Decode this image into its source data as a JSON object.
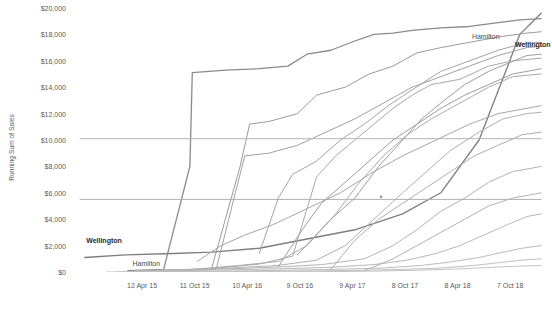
{
  "chart_data": {
    "type": "line",
    "title": "",
    "xlabel": "",
    "ylabel": "Running Sum of Sales",
    "ylim": [
      0,
      20000
    ],
    "grid": false,
    "legend": "none",
    "y_ticks": [
      "$0",
      "$2,000",
      "$4,000",
      "$6,000",
      "$8,000",
      "$10,000",
      "$12,000",
      "$14,000",
      "$16,000",
      "$18,000",
      "$20,000"
    ],
    "y_tick_values": [
      0,
      2000,
      4000,
      6000,
      8000,
      10000,
      12000,
      14000,
      16000,
      18000,
      20000
    ],
    "x_ticks": [
      "12 Apr 15",
      "11 Oct 15",
      "10 Apr 16",
      "9 Oct 16",
      "9 Apr 17",
      "8 Oct 17",
      "8 Apr 18",
      "7 Oct 18"
    ],
    "x_tick_positions": [
      0.155,
      0.265,
      0.375,
      0.485,
      0.595,
      0.705,
      0.815,
      0.925
    ],
    "annotations": [
      {
        "name": "hamilton-top-label",
        "text": "Hamilton",
        "x": 0.845,
        "y": 0.115,
        "bold": false
      },
      {
        "name": "wellington-top-label",
        "text": "Wellington",
        "x": 0.935,
        "y": 0.145,
        "bold": true
      },
      {
        "name": "wellington-bottom-label",
        "text": "Wellington",
        "x": 0.038,
        "y": 0.885,
        "bold": true
      },
      {
        "name": "hamilton-bottom-label",
        "text": "Hamilton",
        "x": 0.135,
        "y": 0.975,
        "bold": false
      }
    ],
    "series": [
      {
        "name": "Wellington",
        "color": "#7d7d7d",
        "width": 1.3,
        "points": [
          [
            0.035,
            0.945
          ],
          [
            0.12,
            0.935
          ],
          [
            0.22,
            0.93
          ],
          [
            0.3,
            0.925
          ],
          [
            0.4,
            0.91
          ],
          [
            0.5,
            0.875
          ],
          [
            0.6,
            0.84
          ],
          [
            0.7,
            0.78
          ],
          [
            0.78,
            0.7
          ],
          [
            0.86,
            0.5
          ],
          [
            0.92,
            0.22
          ],
          [
            0.945,
            0.1
          ],
          [
            0.99,
            0.02
          ]
        ]
      },
      {
        "name": "Hamilton",
        "color": "#8a8a8a",
        "width": 1.3,
        "points": [
          [
            0.125,
            0.995
          ],
          [
            0.2,
            0.99
          ],
          [
            0.255,
            0.6
          ],
          [
            0.26,
            0.245
          ],
          [
            0.33,
            0.235
          ],
          [
            0.4,
            0.23
          ],
          [
            0.46,
            0.22
          ],
          [
            0.5,
            0.175
          ],
          [
            0.55,
            0.16
          ],
          [
            0.6,
            0.125
          ],
          [
            0.64,
            0.1
          ],
          [
            0.68,
            0.095
          ],
          [
            0.72,
            0.085
          ],
          [
            0.78,
            0.075
          ],
          [
            0.84,
            0.07
          ],
          [
            0.9,
            0.055
          ],
          [
            0.945,
            0.045
          ],
          [
            0.99,
            0.04
          ]
        ]
      },
      {
        "name": "series-3",
        "color": "#9a9a9a",
        "width": 1,
        "points": [
          [
            0.3,
            0.99
          ],
          [
            0.36,
            0.6
          ],
          [
            0.38,
            0.44
          ],
          [
            0.42,
            0.43
          ],
          [
            0.48,
            0.4
          ],
          [
            0.52,
            0.33
          ],
          [
            0.58,
            0.3
          ],
          [
            0.63,
            0.25
          ],
          [
            0.68,
            0.22
          ],
          [
            0.73,
            0.17
          ],
          [
            0.78,
            0.15
          ],
          [
            0.84,
            0.13
          ],
          [
            0.9,
            0.11
          ],
          [
            0.96,
            0.095
          ],
          [
            0.99,
            0.09
          ]
        ]
      },
      {
        "name": "series-4",
        "color": "#a0a0a0",
        "width": 1,
        "points": [
          [
            0.22,
            0.995
          ],
          [
            0.31,
            0.99
          ],
          [
            0.35,
            0.7
          ],
          [
            0.37,
            0.56
          ],
          [
            0.42,
            0.55
          ],
          [
            0.48,
            0.52
          ],
          [
            0.54,
            0.47
          ],
          [
            0.6,
            0.42
          ],
          [
            0.66,
            0.36
          ],
          [
            0.72,
            0.3
          ],
          [
            0.78,
            0.26
          ],
          [
            0.84,
            0.22
          ],
          [
            0.9,
            0.18
          ],
          [
            0.96,
            0.15
          ],
          [
            0.99,
            0.145
          ]
        ]
      },
      {
        "name": "series-5",
        "color": "#a8a8a8",
        "width": 1,
        "points": [
          [
            0.18,
            0.995
          ],
          [
            0.28,
            0.99
          ],
          [
            0.4,
            0.97
          ],
          [
            0.47,
            0.94
          ],
          [
            0.52,
            0.64
          ],
          [
            0.56,
            0.56
          ],
          [
            0.6,
            0.5
          ],
          [
            0.64,
            0.44
          ],
          [
            0.68,
            0.38
          ],
          [
            0.72,
            0.33
          ],
          [
            0.76,
            0.29
          ],
          [
            0.82,
            0.27
          ],
          [
            0.88,
            0.22
          ],
          [
            0.93,
            0.2
          ],
          [
            0.99,
            0.19
          ]
        ]
      },
      {
        "name": "series-6",
        "color": "#ababab",
        "width": 1,
        "points": [
          [
            0.16,
            0.995
          ],
          [
            0.26,
            0.99
          ],
          [
            0.36,
            0.975
          ],
          [
            0.44,
            0.96
          ],
          [
            0.5,
            0.9
          ],
          [
            0.56,
            0.78
          ],
          [
            0.61,
            0.66
          ],
          [
            0.66,
            0.56
          ],
          [
            0.71,
            0.48
          ],
          [
            0.76,
            0.42
          ],
          [
            0.82,
            0.36
          ],
          [
            0.88,
            0.3
          ],
          [
            0.93,
            0.26
          ],
          [
            0.99,
            0.25
          ]
        ]
      },
      {
        "name": "series-7",
        "color": "#b0b0b0",
        "width": 1,
        "points": [
          [
            0.14,
            0.995
          ],
          [
            0.25,
            0.99
          ],
          [
            0.34,
            0.985
          ],
          [
            0.44,
            0.975
          ],
          [
            0.52,
            0.955
          ],
          [
            0.58,
            0.9
          ],
          [
            0.64,
            0.8
          ],
          [
            0.7,
            0.7
          ],
          [
            0.75,
            0.62
          ],
          [
            0.8,
            0.54
          ],
          [
            0.86,
            0.47
          ],
          [
            0.91,
            0.42
          ],
          [
            0.96,
            0.4
          ],
          [
            0.99,
            0.395
          ]
        ]
      },
      {
        "name": "series-8",
        "color": "#b4b4b4",
        "width": 1,
        "points": [
          [
            0.13,
            0.998
          ],
          [
            0.24,
            0.992
          ],
          [
            0.33,
            0.988
          ],
          [
            0.43,
            0.982
          ],
          [
            0.53,
            0.972
          ],
          [
            0.62,
            0.95
          ],
          [
            0.68,
            0.9
          ],
          [
            0.73,
            0.84
          ],
          [
            0.78,
            0.77
          ],
          [
            0.83,
            0.72
          ],
          [
            0.88,
            0.66
          ],
          [
            0.93,
            0.62
          ],
          [
            0.99,
            0.6
          ]
        ]
      },
      {
        "name": "series-9",
        "color": "#b8b8b8",
        "width": 1,
        "points": [
          [
            0.12,
            0.999
          ],
          [
            0.23,
            0.995
          ],
          [
            0.33,
            0.992
          ],
          [
            0.44,
            0.988
          ],
          [
            0.55,
            0.982
          ],
          [
            0.64,
            0.972
          ],
          [
            0.71,
            0.955
          ],
          [
            0.77,
            0.93
          ],
          [
            0.82,
            0.9
          ],
          [
            0.87,
            0.86
          ],
          [
            0.92,
            0.82
          ],
          [
            0.96,
            0.79
          ],
          [
            0.99,
            0.78
          ]
        ]
      },
      {
        "name": "series-10",
        "color": "#bcbcbc",
        "width": 1,
        "points": [
          [
            0.1,
            1.0
          ],
          [
            0.25,
            0.998
          ],
          [
            0.4,
            0.995
          ],
          [
            0.55,
            0.99
          ],
          [
            0.66,
            0.985
          ],
          [
            0.74,
            0.975
          ],
          [
            0.8,
            0.962
          ],
          [
            0.86,
            0.945
          ],
          [
            0.91,
            0.925
          ],
          [
            0.95,
            0.91
          ],
          [
            0.99,
            0.9
          ]
        ]
      },
      {
        "name": "series-11",
        "color": "#c0c0c0",
        "width": 1,
        "points": [
          [
            0.08,
            1.0
          ],
          [
            0.28,
            0.999
          ],
          [
            0.46,
            0.997
          ],
          [
            0.6,
            0.994
          ],
          [
            0.7,
            0.99
          ],
          [
            0.78,
            0.985
          ],
          [
            0.85,
            0.975
          ],
          [
            0.9,
            0.965
          ],
          [
            0.95,
            0.955
          ],
          [
            0.99,
            0.95
          ]
        ]
      },
      {
        "name": "series-12",
        "color": "#c4c4c4",
        "width": 1,
        "points": [
          [
            0.33,
            1.0
          ],
          [
            0.5,
            0.999
          ],
          [
            0.63,
            0.997
          ],
          [
            0.74,
            0.993
          ],
          [
            0.82,
            0.988
          ],
          [
            0.89,
            0.982
          ],
          [
            0.94,
            0.978
          ],
          [
            0.99,
            0.975
          ]
        ]
      },
      {
        "name": "series-13-flat-10000",
        "color": "#b6b6b6",
        "width": 1,
        "points": [
          [
            0.025,
            0.495
          ],
          [
            0.99,
            0.495
          ]
        ]
      },
      {
        "name": "series-14-flat-5500",
        "color": "#b0b0b0",
        "width": 1,
        "points": [
          [
            0.025,
            0.725
          ],
          [
            0.99,
            0.725
          ]
        ]
      },
      {
        "name": "series-15",
        "color": "#9e9e9e",
        "width": 1,
        "points": [
          [
            0.48,
            0.935
          ],
          [
            0.55,
            0.8
          ],
          [
            0.6,
            0.72
          ],
          [
            0.65,
            0.6
          ],
          [
            0.7,
            0.5
          ],
          [
            0.74,
            0.42
          ],
          [
            0.78,
            0.36
          ],
          [
            0.83,
            0.29
          ],
          [
            0.88,
            0.24
          ],
          [
            0.92,
            0.21
          ],
          [
            0.96,
            0.18
          ],
          [
            0.99,
            0.175
          ]
        ]
      },
      {
        "name": "series-16",
        "color": "#a4a4a4",
        "width": 1,
        "points": [
          [
            0.4,
            0.93
          ],
          [
            0.44,
            0.72
          ],
          [
            0.47,
            0.63
          ],
          [
            0.52,
            0.58
          ],
          [
            0.57,
            0.5
          ],
          [
            0.62,
            0.44
          ],
          [
            0.67,
            0.37
          ],
          [
            0.72,
            0.31
          ],
          [
            0.78,
            0.24
          ],
          [
            0.84,
            0.2
          ],
          [
            0.9,
            0.16
          ],
          [
            0.95,
            0.135
          ],
          [
            0.99,
            0.13
          ]
        ]
      },
      {
        "name": "series-17",
        "color": "#adadad",
        "width": 1,
        "points": [
          [
            0.55,
            0.99
          ],
          [
            0.6,
            0.88
          ],
          [
            0.65,
            0.8
          ],
          [
            0.7,
            0.74
          ],
          [
            0.75,
            0.68
          ],
          [
            0.8,
            0.62
          ],
          [
            0.85,
            0.56
          ],
          [
            0.9,
            0.52
          ],
          [
            0.95,
            0.48
          ],
          [
            0.99,
            0.47
          ]
        ]
      },
      {
        "name": "series-18",
        "color": "#b2b2b2",
        "width": 1,
        "points": [
          [
            0.62,
            0.995
          ],
          [
            0.68,
            0.95
          ],
          [
            0.73,
            0.9
          ],
          [
            0.78,
            0.85
          ],
          [
            0.83,
            0.8
          ],
          [
            0.88,
            0.75
          ],
          [
            0.93,
            0.72
          ],
          [
            0.99,
            0.7
          ]
        ]
      },
      {
        "name": "series-19",
        "color": "#a6a6a6",
        "width": 1,
        "points": [
          [
            0.27,
            0.96
          ],
          [
            0.32,
            0.9
          ],
          [
            0.37,
            0.86
          ],
          [
            0.43,
            0.82
          ],
          [
            0.5,
            0.76
          ],
          [
            0.57,
            0.7
          ],
          [
            0.64,
            0.62
          ],
          [
            0.7,
            0.56
          ],
          [
            0.77,
            0.5
          ],
          [
            0.84,
            0.44
          ],
          [
            0.9,
            0.4
          ],
          [
            0.99,
            0.37
          ]
        ]
      },
      {
        "name": "series-20",
        "color": "#9c9c9c",
        "width": 1,
        "points": [
          [
            0.44,
            0.98
          ],
          [
            0.49,
            0.84
          ],
          [
            0.53,
            0.74
          ],
          [
            0.58,
            0.66
          ],
          [
            0.63,
            0.58
          ],
          [
            0.68,
            0.5
          ],
          [
            0.73,
            0.44
          ],
          [
            0.78,
            0.38
          ],
          [
            0.83,
            0.33
          ],
          [
            0.88,
            0.29
          ],
          [
            0.93,
            0.25
          ],
          [
            0.99,
            0.23
          ]
        ]
      }
    ],
    "dot": {
      "name": "data-point-marker",
      "x": 0.655,
      "y": 0.715
    }
  }
}
